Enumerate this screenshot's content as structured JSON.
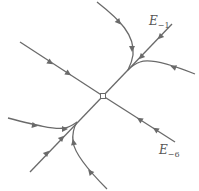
{
  "diagram": {
    "type": "phase-portrait",
    "equilibrium": "stable node at origin",
    "labels": {
      "slow_eigenline": {
        "name": "E",
        "sub": "−1"
      },
      "fast_eigenline": {
        "name": "E",
        "sub": "−6"
      }
    },
    "colors": {
      "trajectory": "#6a6a6a",
      "label": "#555555"
    }
  }
}
